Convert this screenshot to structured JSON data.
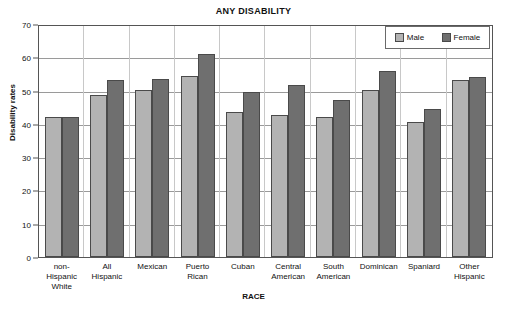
{
  "chart_data": {
    "type": "bar",
    "title": "ANY DISABILITY",
    "xlabel": "RACE",
    "ylabel": "Disability rates",
    "ylim": [
      0,
      70
    ],
    "yticks": [
      0,
      10,
      20,
      30,
      40,
      50,
      60,
      70
    ],
    "grid": true,
    "legend_position": "top-right",
    "categories": [
      "non-Hispanic White",
      "All Hispanic",
      "Mexican",
      "Puerto Rican",
      "Cuban",
      "Central American",
      "South American",
      "Dominican",
      "Spaniard",
      "Other Hispanic"
    ],
    "category_lines": [
      [
        "non-",
        "Hispanic",
        "White"
      ],
      [
        "All",
        "Hispanic"
      ],
      [
        "Mexican"
      ],
      [
        "Puerto",
        "Rican"
      ],
      [
        "Cuban"
      ],
      [
        "Central",
        "American"
      ],
      [
        "South",
        "American"
      ],
      [
        "Dominican"
      ],
      [
        "Spaniard"
      ],
      [
        "Other",
        "Hispanic"
      ]
    ],
    "series": [
      {
        "name": "Male",
        "color": "#b3b3b3",
        "values": [
          42.5,
          49.0,
          50.5,
          55.0,
          44.0,
          43.0,
          42.5,
          50.5,
          41.0,
          53.5
        ]
      },
      {
        "name": "Female",
        "color": "#6f6f6f",
        "values": [
          42.5,
          53.5,
          53.8,
          61.5,
          50.0,
          52.0,
          47.5,
          56.5,
          45.0,
          54.5
        ]
      }
    ]
  },
  "legend": {
    "items": [
      {
        "label": "Male"
      },
      {
        "label": "Female"
      }
    ]
  }
}
